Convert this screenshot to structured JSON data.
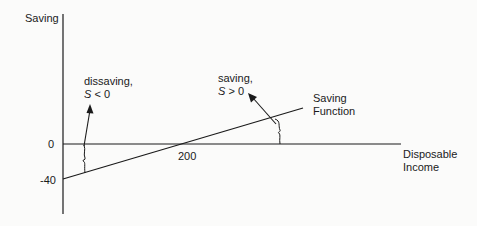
{
  "diagram": {
    "title": "Saving Function",
    "y_axis": {
      "label": "Saving",
      "ticks": [
        {
          "value": 0,
          "label": "0"
        },
        {
          "value": -40,
          "label": "-40"
        }
      ]
    },
    "x_axis": {
      "label_line1": "Disposable",
      "label_line2": "Income",
      "ticks": [
        {
          "value": 200,
          "label": "200"
        }
      ]
    },
    "line": {
      "name": "Saving Function",
      "label_line1": "Saving",
      "label_line2": "Function",
      "intercept": -40,
      "break_even_income": 200
    },
    "annotations": {
      "dissaving": {
        "line1": "dissaving,",
        "var": "S",
        "relation": " < 0"
      },
      "saving": {
        "line1": "saving,",
        "var": "S",
        "relation": " > 0"
      }
    },
    "colors": {
      "line": "#1a1a1a",
      "background": "#fbfbfa"
    }
  }
}
